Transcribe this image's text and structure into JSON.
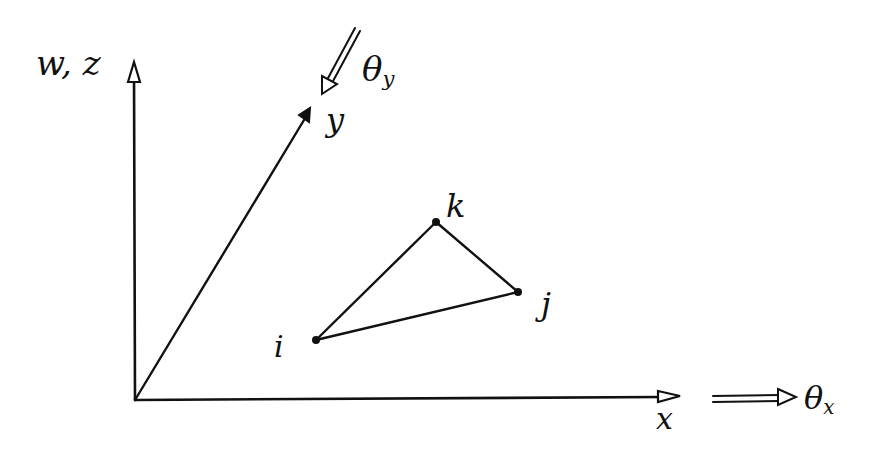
{
  "diagram": {
    "type": "coordinate-system-with-triangle-element",
    "stroke_color": "#111111",
    "background": "#ffffff",
    "axes": {
      "vertical": {
        "label": "w, z",
        "from": [
          135,
          400
        ],
        "to": [
          134,
          62
        ]
      },
      "horizontal": {
        "label": "x",
        "from": [
          135,
          400
        ],
        "to": [
          680,
          397
        ]
      },
      "oblique": {
        "label": "y",
        "from": [
          135,
          400
        ],
        "to": [
          310,
          110
        ]
      }
    },
    "rotations": {
      "theta_x": {
        "label_main": "θ",
        "label_sub": "x",
        "from": [
          713,
          400
        ],
        "to": [
          795,
          398
        ]
      },
      "theta_y": {
        "label_main": "θ",
        "label_sub": "y",
        "from": [
          357,
          30
        ],
        "to": [
          322,
          93
        ]
      }
    },
    "triangle": {
      "nodes": [
        {
          "id": "i",
          "label": "i",
          "pos": [
            316,
            340
          ]
        },
        {
          "id": "j",
          "label": "j",
          "pos": [
            518,
            292
          ]
        },
        {
          "id": "k",
          "label": "k",
          "pos": [
            436,
            222
          ]
        }
      ],
      "edges": [
        [
          "i",
          "j"
        ],
        [
          "j",
          "k"
        ],
        [
          "k",
          "i"
        ]
      ]
    }
  }
}
